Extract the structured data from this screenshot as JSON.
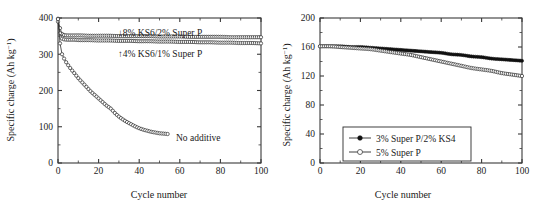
{
  "figure": {
    "panels": [
      {
        "id": "left",
        "xlabel": "Cycle number",
        "ylabel_main": "Specific charge (Ah kg",
        "ylabel_sup": "−1",
        "ylabel_tail": ")",
        "annotations": [
          {
            "name": "annotation-8pct",
            "text": "↓8% KS6/2% Super P"
          },
          {
            "name": "annotation-4pct",
            "text": "↑4% KS6/1% Super P"
          },
          {
            "name": "annotation-no-additive",
            "text": "No additive"
          }
        ]
      },
      {
        "id": "right",
        "xlabel": "Cycle number",
        "ylabel_main": "Specific charge (Ah kg",
        "ylabel_sup": "−1",
        "ylabel_tail": ")",
        "legend": [
          {
            "name": "legend-entry-superp-ks4",
            "label": "3% Super P/2% KS4",
            "marker": "filled-circle"
          },
          {
            "name": "legend-entry-superp",
            "label": "5% Super P",
            "marker": "open-circle"
          }
        ]
      }
    ]
  },
  "chart_data": [
    {
      "type": "line",
      "id": "left-panel",
      "title": "",
      "xlabel": "Cycle number",
      "ylabel": "Specific charge (Ah kg−1)",
      "xlim": [
        0,
        100
      ],
      "ylim": [
        0,
        400
      ],
      "xticks": [
        0,
        20,
        40,
        60,
        80,
        100
      ],
      "yticks": [
        0,
        100,
        200,
        300,
        400
      ],
      "xtick_labels": [
        "0",
        "20",
        "40",
        "60",
        "80",
        "100"
      ],
      "ytick_labels": [
        "0",
        "100",
        "200",
        "300",
        "400"
      ],
      "grid": false,
      "legend_position": "inline-annotations",
      "series": [
        {
          "name": "8% KS6/2% Super P",
          "marker": "open-circle",
          "x": [
            0,
            1,
            2,
            3,
            5,
            8,
            11,
            15,
            20,
            25,
            30,
            35,
            40,
            45,
            50,
            55,
            60,
            65,
            70,
            75,
            80,
            85,
            90,
            95,
            100
          ],
          "y": [
            398,
            372,
            356,
            353,
            352,
            352,
            352,
            351,
            351,
            351,
            350,
            350,
            350,
            350,
            349,
            349,
            349,
            348,
            348,
            348,
            348,
            347,
            347,
            347,
            347
          ]
        },
        {
          "name": "4% KS6/1% Super P",
          "marker": "open-circle",
          "x": [
            0,
            1,
            2,
            3,
            5,
            8,
            11,
            15,
            20,
            25,
            30,
            35,
            40,
            45,
            50,
            55,
            60,
            65,
            70,
            75,
            80,
            85,
            90,
            95,
            100
          ],
          "y": [
            390,
            358,
            343,
            341,
            340,
            340,
            339,
            339,
            338,
            338,
            337,
            337,
            336,
            336,
            335,
            335,
            334,
            334,
            333,
            333,
            332,
            332,
            331,
            331,
            330
          ]
        },
        {
          "name": "No additive",
          "marker": "open-circle",
          "x": [
            0,
            1,
            2,
            3,
            4,
            6,
            8,
            10,
            12,
            14,
            16,
            18,
            20,
            22,
            24,
            26,
            28,
            30,
            32,
            34,
            36,
            38,
            40,
            42,
            44,
            46,
            48,
            50,
            52,
            54
          ],
          "y": [
            397,
            330,
            300,
            288,
            278,
            262,
            248,
            234,
            222,
            210,
            198,
            188,
            178,
            168,
            158,
            150,
            138,
            128,
            120,
            113,
            107,
            101,
            96,
            92,
            89,
            86,
            84,
            82,
            81,
            80
          ]
        }
      ]
    },
    {
      "type": "line",
      "id": "right-panel",
      "title": "",
      "xlabel": "Cycle number",
      "ylabel": "Specific charge (Ah kg−1)",
      "xlim": [
        0,
        100
      ],
      "ylim": [
        0,
        200
      ],
      "xticks": [
        0,
        20,
        40,
        60,
        80,
        100
      ],
      "yticks": [
        0,
        40,
        80,
        120,
        160,
        200
      ],
      "xtick_labels": [
        "0",
        "20",
        "40",
        "60",
        "80",
        "100"
      ],
      "ytick_labels": [
        "0",
        "40",
        "80",
        "120",
        "160",
        "200"
      ],
      "grid": false,
      "legend_position": "lower-center",
      "series": [
        {
          "name": "3% Super P/2% KS4",
          "marker": "filled-circle",
          "x": [
            0,
            5,
            10,
            15,
            20,
            25,
            30,
            35,
            40,
            45,
            50,
            55,
            60,
            65,
            70,
            75,
            80,
            85,
            90,
            95,
            100
          ],
          "y": [
            161,
            161,
            161,
            160,
            160,
            159,
            158,
            157,
            156,
            155,
            154,
            153,
            152,
            150,
            149,
            147,
            146,
            144,
            143,
            142,
            141
          ]
        },
        {
          "name": "5% Super P",
          "marker": "open-circle",
          "x": [
            0,
            5,
            10,
            15,
            20,
            25,
            30,
            35,
            40,
            45,
            50,
            55,
            60,
            65,
            70,
            75,
            80,
            85,
            90,
            95,
            100
          ],
          "y": [
            161,
            161,
            160,
            159,
            158,
            157,
            155,
            153,
            151,
            149,
            146,
            143,
            140,
            137,
            134,
            131,
            129,
            127,
            124,
            122,
            120
          ]
        }
      ]
    }
  ]
}
